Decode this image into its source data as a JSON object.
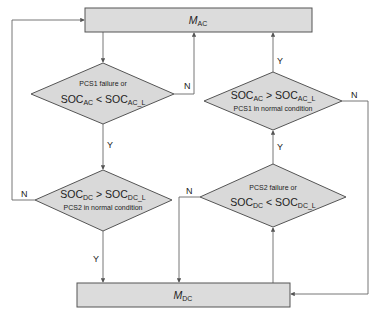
{
  "diagram": {
    "type": "flowchart",
    "colors": {
      "node_fill": "#dcdcdc",
      "stroke": "#555555",
      "edge": "#666666",
      "text": "#222222"
    },
    "nodes": {
      "mac": {
        "label_main": "M",
        "label_sub": "AC"
      },
      "mdc": {
        "label_main": "M",
        "label_sub": "DC"
      },
      "d1": {
        "line1": "PCS1 failure or",
        "soc_a": "SOC",
        "soc_a_sub": "AC",
        "op": " < ",
        "soc_b": "SOC",
        "soc_b_sub": "AC_L"
      },
      "d2": {
        "soc_a": "SOC",
        "soc_a_sub": "AC",
        "op": " > ",
        "soc_b": "SOC",
        "soc_b_sub": "AC_L",
        "line2": "PCS1 in normal condition"
      },
      "d3": {
        "soc_a": "SOC",
        "soc_a_sub": "DC",
        "op": " > ",
        "soc_b": "SOC",
        "soc_b_sub": "DC_L",
        "line2": "PCS2 in normal condition"
      },
      "d4": {
        "line1": "PCS2  failure or",
        "soc_a": "SOC",
        "soc_a_sub": "DC",
        "op": " < ",
        "soc_b": "SOC",
        "soc_b_sub": "DC_L"
      }
    },
    "edge_labels": {
      "d1_no": "N",
      "d1_yes": "Y",
      "d2_yes": "Y",
      "d2_no": "N",
      "d3_no": "N",
      "d3_yes": "Y",
      "d4_no": "N",
      "d4_yes": "Y"
    }
  }
}
